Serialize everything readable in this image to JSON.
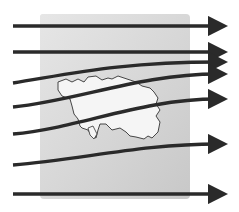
{
  "diagram": {
    "type": "airflow-over-island",
    "colors": {
      "background": "#ffffff",
      "map_panel": "#dcdcdc",
      "map_panel_dark": "#c4c4c4",
      "island_fill": "#f4f4f4",
      "island_outline": "#333333",
      "arrow": "#2a2a2a"
    },
    "map_panel": {
      "x": 40,
      "y": 14,
      "width": 34,
      "height": 85
    },
    "arrows": [
      {
        "label": "flow-1",
        "start_y": 26,
        "end_y": 26
      },
      {
        "label": "flow-2",
        "start_y": 52,
        "end_y": 52
      },
      {
        "label": "flow-3",
        "start_y": 83,
        "end_y": 62
      },
      {
        "label": "flow-4",
        "start_y": 107,
        "end_y": 74
      },
      {
        "label": "flow-5",
        "start_y": 134,
        "end_y": 99
      },
      {
        "label": "flow-6",
        "start_y": 165,
        "end_y": 144
      },
      {
        "label": "flow-7",
        "start_y": 194,
        "end_y": 194
      }
    ]
  }
}
